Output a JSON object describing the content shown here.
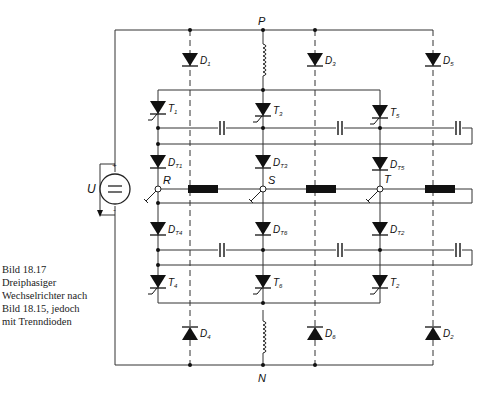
{
  "caption": {
    "number": "Bild 18.17",
    "lines": [
      "Dreiphasiger",
      "Wechselrichter nach",
      "Bild 18.15, jedoch",
      "mit Trenndioden"
    ]
  },
  "nodes": {
    "positive": "P",
    "negative": "N",
    "phase_r": "R",
    "phase_s": "S",
    "phase_t": "T"
  },
  "source": {
    "label": "U",
    "symbol": "=",
    "plus": "+",
    "minus": "-"
  },
  "thyristors": {
    "upper": [
      {
        "main": "T",
        "sub": "1"
      },
      {
        "main": "T",
        "sub": "3"
      },
      {
        "main": "T",
        "sub": "5"
      }
    ],
    "lower": [
      {
        "main": "T",
        "sub": "4"
      },
      {
        "main": "T",
        "sub": "6"
      },
      {
        "main": "T",
        "sub": "2"
      }
    ]
  },
  "separation_diodes": {
    "upper": [
      {
        "main": "D",
        "sub": "T1"
      },
      {
        "main": "D",
        "sub": "T3"
      },
      {
        "main": "D",
        "sub": "T5"
      }
    ],
    "lower": [
      {
        "main": "D",
        "sub": "T4"
      },
      {
        "main": "D",
        "sub": "T6"
      },
      {
        "main": "D",
        "sub": "T2"
      }
    ]
  },
  "freewheel_diodes": {
    "upper": [
      {
        "main": "D",
        "sub": "1"
      },
      {
        "main": "D",
        "sub": "3"
      },
      {
        "main": "D",
        "sub": "5"
      }
    ],
    "lower": [
      {
        "main": "D",
        "sub": "4"
      },
      {
        "main": "D",
        "sub": "6"
      },
      {
        "main": "D",
        "sub": "2"
      }
    ]
  },
  "colors": {
    "line": "#333333",
    "fill": "#111111",
    "text": "#222222",
    "background": "#ffffff"
  }
}
